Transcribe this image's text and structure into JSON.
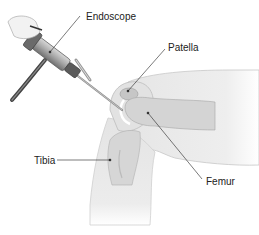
{
  "diagram": {
    "labels": {
      "endoscope": "Endoscope",
      "patella": "Patella",
      "tibia": "Tibia",
      "femur": "Femur"
    }
  }
}
